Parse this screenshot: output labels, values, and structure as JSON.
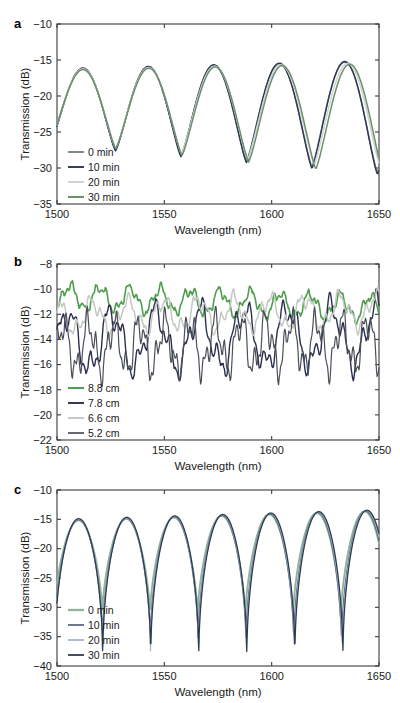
{
  "figure": {
    "panels": [
      "a",
      "b",
      "c"
    ],
    "axis_label_x": "Wavelength (nm)",
    "axis_label_y": "Transmission (dB)"
  },
  "chart_data": [
    {
      "id": "a",
      "panel_label": "a",
      "type": "line",
      "title": "",
      "xlabel": "Wavelength (nm)",
      "ylabel": "Transmission (dB)",
      "xlim": [
        1500,
        1650
      ],
      "ylim": [
        -35,
        -10
      ],
      "xticks": [
        1500,
        1550,
        1600,
        1650
      ],
      "yticks": [
        -35,
        -30,
        -25,
        -20,
        -15,
        -10
      ],
      "grid": false,
      "legend_position": "lower-left",
      "series": [
        {
          "name": "0 min",
          "color": "#7f8c8d",
          "width": 1.5,
          "period_nm": 30.5,
          "phase_nm": 1512,
          "peak_start": -16.3,
          "peak_end": -15.2,
          "trough_start": -26.8,
          "trough_end": -30.6,
          "shift_nm": 0.0
        },
        {
          "name": "10 min",
          "color": "#2f3454",
          "width": 1.4,
          "period_nm": 30.5,
          "phase_nm": 1512,
          "peak_start": -16.2,
          "peak_end": -15.1,
          "trough_start": -26.9,
          "trough_end": -30.9,
          "shift_nm": 0.0
        },
        {
          "name": "20 min",
          "color": "#cfd6cf",
          "width": 1.5,
          "period_nm": 30.5,
          "phase_nm": 1512,
          "peak_start": -16.3,
          "peak_end": -15.4,
          "trough_start": -26.6,
          "trough_end": -30.2,
          "shift_nm": 1.6
        },
        {
          "name": "30 min",
          "color": "#6d8f6d",
          "width": 1.5,
          "period_nm": 30.5,
          "phase_nm": 1512,
          "peak_start": -16.4,
          "peak_end": -15.5,
          "trough_start": -26.5,
          "trough_end": -31.0,
          "shift_nm": 2.8
        }
      ]
    },
    {
      "id": "b",
      "panel_label": "b",
      "type": "line",
      "title": "",
      "xlabel": "Wavelength (nm)",
      "ylabel": "Transmission (dB)",
      "xlim": [
        1500,
        1650
      ],
      "ylim": [
        -22,
        -8
      ],
      "xticks": [
        1500,
        1550,
        1600,
        1650
      ],
      "yticks": [
        -22,
        -20,
        -18,
        -16,
        -14,
        -12,
        -10,
        -8
      ],
      "grid": false,
      "legend_position": "lower-left",
      "series": [
        {
          "name": "8.8 cm",
          "color": "#4f9e4f",
          "width": 1.6,
          "baseline": -10.6,
          "amp1": 0.9,
          "per1": 14.0,
          "ph1": 1506,
          "amp2": 0.35,
          "per2": 5.2,
          "ph2": 1502,
          "amp3": 0.18,
          "per3": 2.3,
          "ph3": 1500,
          "drift": -0.9
        },
        {
          "name": "7.8 cm",
          "color": "#2a2f4f",
          "width": 1.4,
          "baseline": -14.2,
          "amp1": 2.2,
          "per1": 20.5,
          "ph1": 1505,
          "amp2": 0.9,
          "per2": 7.4,
          "ph2": 1501,
          "amp3": 0.45,
          "per3": 3.1,
          "ph3": 1500,
          "drift": 0.6
        },
        {
          "name": "6.6 cm",
          "color": "#c4c9c4",
          "width": 1.5,
          "baseline": -12.2,
          "amp1": 1.1,
          "per1": 16.5,
          "ph1": 1500,
          "amp2": 0.55,
          "per2": 6.1,
          "ph2": 1503,
          "amp3": 0.25,
          "per3": 2.7,
          "ph3": 1501,
          "drift": 0.5
        },
        {
          "name": "5.2 cm",
          "color": "#4a4f58",
          "width": 1.2,
          "baseline": -14.6,
          "amp1": 1.8,
          "per1": 11.8,
          "ph1": 1503,
          "amp2": 1.0,
          "per2": 4.6,
          "ph2": 1500,
          "amp3": 0.5,
          "per3": 2.0,
          "ph3": 1502,
          "drift": 0.3
        }
      ]
    },
    {
      "id": "c",
      "panel_label": "c",
      "type": "line",
      "title": "",
      "xlabel": "Wavelength (nm)",
      "ylabel": "Transmission (dB)",
      "xlim": [
        1500,
        1650
      ],
      "ylim": [
        -40,
        -10
      ],
      "xticks": [
        1500,
        1550,
        1600,
        1650
      ],
      "yticks": [
        -40,
        -35,
        -30,
        -25,
        -20,
        -15,
        -10
      ],
      "grid": false,
      "legend_position": "lower-left",
      "series": [
        {
          "name": "0 min",
          "color": "#8fb39a",
          "width": 1.8,
          "period_nm": 22.2,
          "phase_nm": 1510,
          "peak_start": -15.3,
          "peak_end": -13.6,
          "trough_start": -30.8,
          "trough_end": -32.4,
          "sharpness": 3.2,
          "shift_nm": 0.0
        },
        {
          "name": "10 min",
          "color": "#5b6a86",
          "width": 1.3,
          "period_nm": 22.2,
          "phase_nm": 1510,
          "peak_start": -15.2,
          "peak_end": -13.5,
          "trough_start": -35.5,
          "trough_end": -36.5,
          "sharpness": 3.6,
          "shift_nm": 0.5
        },
        {
          "name": "20 min",
          "color": "#a8b6c4",
          "width": 1.3,
          "period_nm": 22.2,
          "phase_nm": 1510,
          "peak_start": -15.1,
          "peak_end": -13.4,
          "trough_start": -37.5,
          "trough_end": -38.2,
          "sharpness": 3.9,
          "shift_nm": 0.9
        },
        {
          "name": "30 min",
          "color": "#2f3b52",
          "width": 1.3,
          "period_nm": 22.2,
          "phase_nm": 1510,
          "peak_start": -15.0,
          "peak_end": -13.4,
          "trough_start": -39.2,
          "trough_end": -39.4,
          "sharpness": 4.2,
          "shift_nm": 1.2
        }
      ]
    }
  ]
}
